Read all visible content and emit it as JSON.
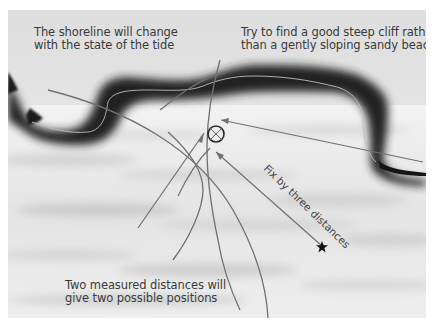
{
  "captions": {
    "shoreline": [
      "The shoreline will change",
      "with the state of the tide"
    ],
    "cliff": [
      "Try to find a good steep cliff rather",
      "than a gently sloping sandy beach"
    ],
    "two_distances": [
      "Two measured distances will",
      "give two possible positions"
    ]
  },
  "labels": {
    "fix": "Fix by three distances"
  },
  "icons": {
    "position_fix": "circle-with-cross",
    "vessel": "star"
  },
  "colors": {
    "sky": "#e6e6e6",
    "land": "#1e1e1e",
    "sea": "#ececec",
    "lines": "#6e6e6e",
    "text": "#3a3a3a",
    "star": "#111111"
  }
}
